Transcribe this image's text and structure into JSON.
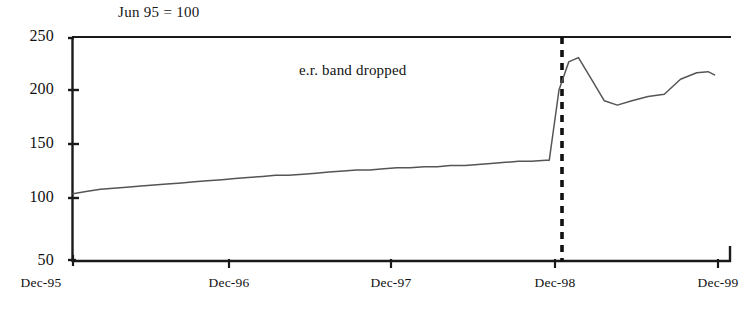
{
  "chart_data": {
    "type": "line",
    "title": "",
    "subtitle": "Jun 95 = 100",
    "xlabel": "",
    "ylabel": "",
    "grid": false,
    "legend": "none",
    "xlim": [
      "Dec-95",
      "Dec-99"
    ],
    "ylim": [
      50,
      250
    ],
    "yticks": [
      50,
      100,
      150,
      200,
      250
    ],
    "ytick_labels": [
      "50",
      "100",
      "150",
      "200",
      "250"
    ],
    "xticks": [
      "Dec-95",
      "Dec-96",
      "Dec-97",
      "Dec-98",
      "Dec-99"
    ],
    "xtick_labels": [
      "Dec-95",
      "Dec-96",
      "Dec-97",
      "Dec-98",
      "Dec-99"
    ],
    "series": [
      {
        "name": "index",
        "color": "#555555",
        "x": [
          0.0,
          0.08,
          0.17,
          0.25,
          0.33,
          0.42,
          0.5,
          0.58,
          0.67,
          0.75,
          0.83,
          0.92,
          1.0,
          1.08,
          1.17,
          1.25,
          1.33,
          1.42,
          1.5,
          1.58,
          1.67,
          1.75,
          1.83,
          1.92,
          2.0,
          2.08,
          2.17,
          2.25,
          2.33,
          2.42,
          2.5,
          2.58,
          2.67,
          2.75,
          2.83,
          2.92,
          2.94,
          3.0,
          3.06,
          3.12,
          3.2,
          3.28,
          3.36,
          3.45,
          3.55,
          3.65,
          3.75,
          3.85,
          3.92,
          3.96
        ],
        "y": [
          104,
          106,
          108,
          109,
          110,
          111,
          112,
          113,
          114,
          115,
          116,
          117,
          118,
          119,
          120,
          121,
          121,
          122,
          123,
          124,
          125,
          126,
          126,
          127,
          128,
          128,
          129,
          129,
          130,
          130,
          131,
          132,
          133,
          134,
          134,
          135,
          135,
          200,
          226,
          230,
          210,
          190,
          186,
          190,
          194,
          196,
          210,
          216,
          217,
          214
        ]
      }
    ],
    "annotations": [
      {
        "kind": "text",
        "label": "e.r. band dropped",
        "x_px": 299,
        "y_px": 62
      },
      {
        "kind": "vline-dashed",
        "label": "exchange-rate band drop date",
        "x": 3.02,
        "color": "#111111"
      }
    ],
    "axis_color": "#1a1a1a"
  }
}
